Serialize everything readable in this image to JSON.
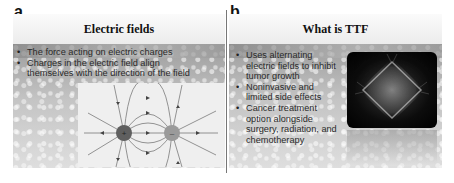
{
  "panels": [
    {
      "letter": "a",
      "title": "Electric fields",
      "bullets": [
        "The force acting on electric charges",
        "Charges in the electric field align themselves with the direction of the field"
      ],
      "bullet_lines": [
        "The force acting on electric charges",
        "Charges in the electric field align",
        "themselves with the direction of",
        "the field"
      ],
      "figure": {
        "type": "dipole-field-diagram",
        "charges": [
          "positive",
          "negative"
        ],
        "charge_colors": [
          "#5f5f5f",
          "#999999"
        ]
      }
    },
    {
      "letter": "b",
      "title": "What is TTF",
      "bullets": [
        "Uses alternating electric fields to inhibit tumor growth",
        "Noninvasive and limited side effects",
        "Cancer treatment option alongside surgery, radiation, and chemotherapy"
      ],
      "figure": {
        "type": "microscopy-image",
        "description": "dividing cell mitotic spindle on black background"
      }
    }
  ],
  "colors": {
    "title_bar": "#f3f3f3",
    "body_bg": "#b8b8b8",
    "field_box": "#efefef",
    "text": "#2a2a2a"
  }
}
